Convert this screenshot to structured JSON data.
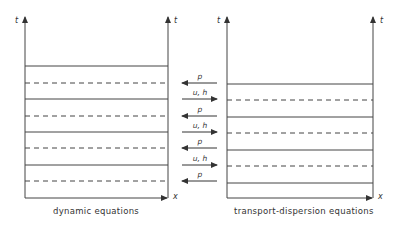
{
  "diagram": {
    "left_panel": {
      "caption": "dynamic equations",
      "axis_left_label": "t",
      "axis_right_label": "t",
      "x_axis_label": "x",
      "lines": [
        {
          "type": "solid",
          "y": 66
        },
        {
          "type": "dashed",
          "y": 83
        },
        {
          "type": "solid",
          "y": 99
        },
        {
          "type": "dashed",
          "y": 116
        },
        {
          "type": "solid",
          "y": 132
        },
        {
          "type": "dashed",
          "y": 148
        },
        {
          "type": "solid",
          "y": 165
        },
        {
          "type": "dashed",
          "y": 181
        }
      ]
    },
    "right_panel": {
      "caption": "transport-dispersion equations",
      "axis_left_label": "t",
      "axis_right_label": "t",
      "x_axis_label": "x",
      "lines": [
        {
          "type": "solid",
          "y": 84
        },
        {
          "type": "dashed",
          "y": 100
        },
        {
          "type": "solid",
          "y": 117
        },
        {
          "type": "dashed",
          "y": 133
        },
        {
          "type": "solid",
          "y": 150
        },
        {
          "type": "dashed",
          "y": 166
        },
        {
          "type": "solid",
          "y": 183
        }
      ]
    },
    "exchange_arrows": [
      {
        "label": "p",
        "direction": "left",
        "y": 83
      },
      {
        "label": "u, h",
        "direction": "right",
        "y": 99
      },
      {
        "label": "p",
        "direction": "left",
        "y": 116
      },
      {
        "label": "u, h",
        "direction": "right",
        "y": 132
      },
      {
        "label": "p",
        "direction": "left",
        "y": 148
      },
      {
        "label": "u, h",
        "direction": "right",
        "y": 165
      },
      {
        "label": "p",
        "direction": "left",
        "y": 181
      }
    ],
    "colors": {
      "line": "#444444",
      "background": "#ffffff"
    }
  }
}
